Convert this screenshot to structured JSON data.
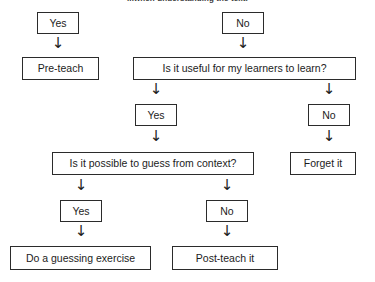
{
  "title": "...when understanding the text.",
  "colors": {
    "background": "#ffffff",
    "border": "#2b2b2b",
    "text": "#1c1c1c",
    "title_text": "#3a3a3a"
  },
  "arrow_glyph": "↓",
  "nodes": [
    {
      "id": "yes-top-left",
      "label": "Yes",
      "x": 37,
      "y": 12,
      "w": 42,
      "h": 22
    },
    {
      "id": "no-top-right",
      "label": "No",
      "x": 222,
      "y": 12,
      "w": 42,
      "h": 22
    },
    {
      "id": "pre-teach",
      "label": "Pre-teach",
      "x": 22,
      "y": 57,
      "w": 77,
      "h": 23
    },
    {
      "id": "useful-question",
      "label": "Is it useful for my learners to learn?",
      "x": 133,
      "y": 57,
      "w": 223,
      "h": 23
    },
    {
      "id": "yes-second",
      "label": "Yes",
      "x": 135,
      "y": 104,
      "w": 42,
      "h": 22
    },
    {
      "id": "no-second",
      "label": "No",
      "x": 308,
      "y": 104,
      "w": 42,
      "h": 22
    },
    {
      "id": "guess-question",
      "label": "Is it possible to guess from context?",
      "x": 52,
      "y": 152,
      "w": 202,
      "h": 23
    },
    {
      "id": "forget-it",
      "label": "Forget it",
      "x": 290,
      "y": 152,
      "w": 66,
      "h": 23
    },
    {
      "id": "yes-third",
      "label": "Yes",
      "x": 60,
      "y": 200,
      "w": 42,
      "h": 22
    },
    {
      "id": "no-third",
      "label": "No",
      "x": 206,
      "y": 200,
      "w": 42,
      "h": 22
    },
    {
      "id": "guessing-exercise",
      "label": "Do a guessing exercise",
      "x": 10,
      "y": 246,
      "w": 141,
      "h": 24
    },
    {
      "id": "post-teach-it",
      "label": "Post-teach it",
      "x": 172,
      "y": 246,
      "w": 106,
      "h": 24
    }
  ],
  "arrows": [
    {
      "id": "arrow-yes-to-preteach",
      "x": 51,
      "y": 36
    },
    {
      "id": "arrow-no-to-useful",
      "x": 236,
      "y": 36
    },
    {
      "id": "arrow-useful-to-yes",
      "x": 149,
      "y": 82
    },
    {
      "id": "arrow-useful-to-no",
      "x": 322,
      "y": 82
    },
    {
      "id": "arrow-yes-to-guess",
      "x": 149,
      "y": 129
    },
    {
      "id": "arrow-no-to-forget",
      "x": 322,
      "y": 129
    },
    {
      "id": "arrow-guess-to-yes",
      "x": 74,
      "y": 178
    },
    {
      "id": "arrow-guess-to-no",
      "x": 220,
      "y": 178
    },
    {
      "id": "arrow-yes-to-exercise",
      "x": 74,
      "y": 224
    },
    {
      "id": "arrow-no-to-postteach",
      "x": 220,
      "y": 224
    }
  ]
}
